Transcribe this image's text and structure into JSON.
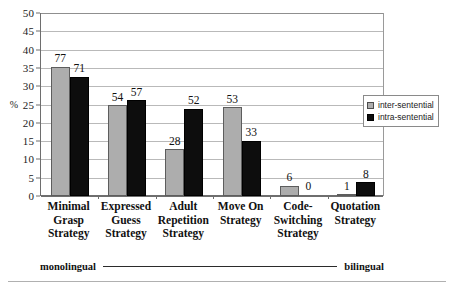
{
  "chart_data": {
    "type": "bar",
    "title": "",
    "subtitle": "",
    "xlabel": "",
    "ylabel": "%",
    "ylim": [
      0,
      50
    ],
    "ytick_step": 5,
    "yticks": [
      "50",
      "45",
      "40",
      "35",
      "30",
      "25",
      "20",
      "15",
      "10",
      "5",
      "0"
    ],
    "grid": true,
    "legend_position": "right-inside",
    "categories": [
      "Minimal\nGrasp\nStrategy",
      "Expressed\nGuess\nStrategy",
      "Adult\nRepetition\nStrategy",
      "Move On\nStrategy",
      "Code-\nSwitching\nStrategy",
      "Quotation\nStrategy"
    ],
    "category_lines": [
      [
        "Minimal",
        "Grasp",
        "Strategy"
      ],
      [
        "Expressed",
        "Guess",
        "Strategy"
      ],
      [
        "Adult",
        "Repetition",
        "Strategy"
      ],
      [
        "Move On",
        "Strategy"
      ],
      [
        "Code-",
        "Switching",
        "Strategy"
      ],
      [
        "Quotation",
        "Strategy"
      ]
    ],
    "series": [
      {
        "name": "inter-sentential",
        "color": "#adadad",
        "values": [
          35.3,
          24.8,
          12.8,
          24.3,
          2.8,
          0.5
        ],
        "counts": [
          77,
          54,
          28,
          53,
          6,
          1
        ]
      },
      {
        "name": "intra-sentential",
        "color": "#0d0d0d",
        "values": [
          32.6,
          26.1,
          23.9,
          15.1,
          0,
          3.7
        ],
        "counts": [
          71,
          57,
          52,
          33,
          0,
          8
        ]
      }
    ],
    "annotations": {
      "left_end": "monolingual",
      "right_end": "bilingual"
    }
  },
  "legend": {
    "items": [
      {
        "label": "inter-sentential"
      },
      {
        "label": "intra-sentential"
      }
    ]
  },
  "axis": {
    "percent_symbol": "%"
  }
}
